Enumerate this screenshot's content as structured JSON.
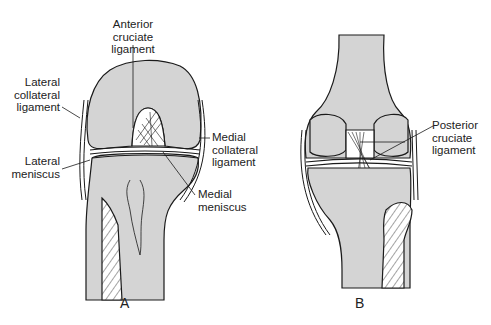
{
  "figure": {
    "colors": {
      "bone_fill": "#d4d4d4",
      "outline": "#1a1a1a",
      "background": "#ffffff"
    },
    "panels": [
      {
        "id": "A",
        "letter": "A",
        "view": "anterior",
        "labels": [
          {
            "key": "acl",
            "text": "Anterior\ncruciate\nligament"
          },
          {
            "key": "lcl",
            "text": "Lateral\ncollateral\nligament"
          },
          {
            "key": "lateral_meniscus",
            "text": "Lateral\nmeniscus"
          },
          {
            "key": "mcl",
            "text": "Medial\ncollateral\nligament"
          },
          {
            "key": "medial_meniscus",
            "text": "Medial\nmeniscus"
          }
        ]
      },
      {
        "id": "B",
        "letter": "B",
        "view": "posterior",
        "labels": [
          {
            "key": "pcl",
            "text": "Posterior\ncruciate\nligament"
          }
        ]
      }
    ]
  }
}
